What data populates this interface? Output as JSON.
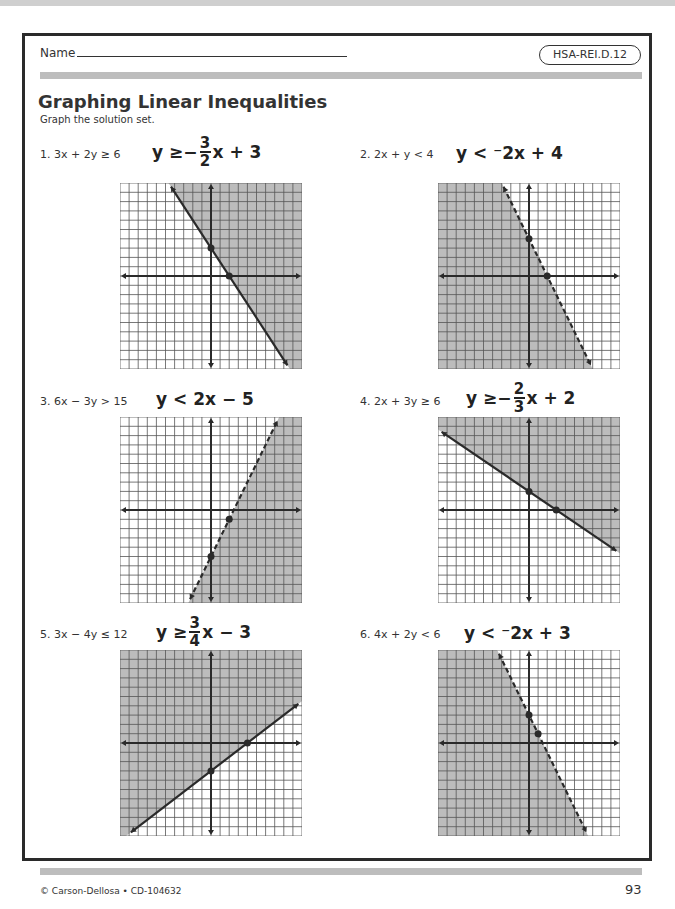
{
  "header": {
    "name_label": "Name",
    "standard": "HSA-REI.D.12"
  },
  "title": "Graphing Linear Inequalities",
  "instructions": "Graph the solution set.",
  "colors": {
    "shade": "#bcbcbc",
    "grid": "#555555",
    "ink": "#2a2a2a"
  },
  "problems": [
    {
      "num": "1.",
      "inequality": "3x + 2y ≥ 6",
      "answer_lhs": "y ≥ ",
      "answer_sign": "−",
      "answer_frac_num": "3",
      "answer_frac_den": "2",
      "answer_rhs": "x + 3"
    },
    {
      "num": "2.",
      "inequality": "2x + y < 4",
      "answer_lhs": "y < ",
      "answer_sign": "⁻",
      "answer_frac_num": "",
      "answer_frac_den": "",
      "answer_rhs": "2x + 4"
    },
    {
      "num": "3.",
      "inequality": "6x − 3y > 15",
      "answer_lhs": "y < ",
      "answer_sign": "",
      "answer_frac_num": "",
      "answer_frac_den": "",
      "answer_rhs": "2x − 5"
    },
    {
      "num": "4.",
      "inequality": "2x + 3y ≥ 6",
      "answer_lhs": "y ≥ ",
      "answer_sign": "−",
      "answer_frac_num": "2",
      "answer_frac_den": "3",
      "answer_rhs": "x + 2"
    },
    {
      "num": "5.",
      "inequality": "3x − 4y ≤ 12",
      "answer_lhs": "y ≥ ",
      "answer_sign": "",
      "answer_frac_num": "3",
      "answer_frac_den": "4",
      "answer_rhs": "x − 3"
    },
    {
      "num": "6.",
      "inequality": "4x + 2y < 6",
      "answer_lhs": "y < ",
      "answer_sign": "⁻",
      "answer_frac_num": "",
      "answer_frac_den": "",
      "answer_rhs": "2x + 3"
    }
  ],
  "chart_data": [
    {
      "type": "line",
      "title": "1. y ≥ -3/2 x + 3",
      "xlim": [
        -10,
        10
      ],
      "ylim": [
        -10,
        10
      ],
      "grid": true,
      "slope": -1.5,
      "intercept": 3,
      "boundary": "solid",
      "shade": "above",
      "points": [
        [
          0,
          3
        ],
        [
          2,
          0
        ]
      ]
    },
    {
      "type": "line",
      "title": "2. y < -2x + 4",
      "xlim": [
        -10,
        10
      ],
      "ylim": [
        -10,
        10
      ],
      "grid": true,
      "slope": -2,
      "intercept": 4,
      "boundary": "dashed",
      "shade": "below",
      "points": [
        [
          0,
          4
        ],
        [
          2,
          0
        ]
      ]
    },
    {
      "type": "line",
      "title": "3. y < 2x - 5",
      "xlim": [
        -10,
        10
      ],
      "ylim": [
        -10,
        10
      ],
      "grid": true,
      "slope": 2,
      "intercept": -5,
      "boundary": "dashed",
      "shade": "below",
      "points": [
        [
          0,
          -5
        ],
        [
          2,
          -1
        ]
      ]
    },
    {
      "type": "line",
      "title": "4. y ≥ -2/3 x + 2",
      "xlim": [
        -10,
        10
      ],
      "ylim": [
        -10,
        10
      ],
      "grid": true,
      "slope": -0.6667,
      "intercept": 2,
      "boundary": "solid",
      "shade": "above",
      "points": [
        [
          0,
          2
        ],
        [
          3,
          0
        ]
      ]
    },
    {
      "type": "line",
      "title": "5. y ≥ 3/4 x - 3",
      "xlim": [
        -10,
        10
      ],
      "ylim": [
        -10,
        10
      ],
      "grid": true,
      "slope": 0.75,
      "intercept": -3,
      "boundary": "solid",
      "shade": "above",
      "points": [
        [
          0,
          -3
        ],
        [
          4,
          0
        ]
      ]
    },
    {
      "type": "line",
      "title": "6. y < -2x + 3",
      "xlim": [
        -10,
        10
      ],
      "ylim": [
        -10,
        10
      ],
      "grid": true,
      "slope": -2,
      "intercept": 3,
      "boundary": "dashed",
      "shade": "below",
      "points": [
        [
          0,
          3
        ],
        [
          1,
          1
        ]
      ]
    }
  ],
  "footer": {
    "copyright": "© Carson-Dellosa • CD-104632",
    "page_number": "93"
  }
}
